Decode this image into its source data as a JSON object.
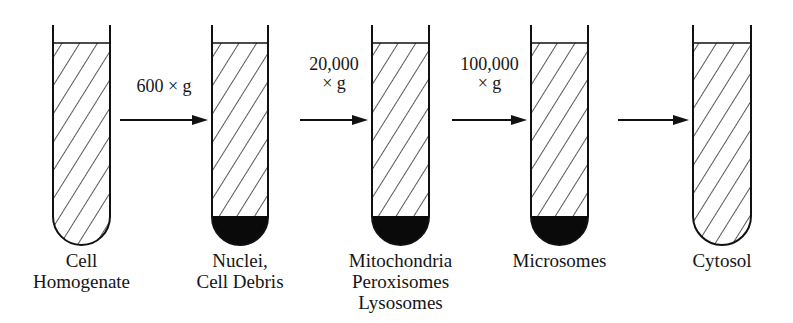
{
  "figure": {
    "colors": {
      "line": "#111111",
      "pellet": "#0a0a0a",
      "background": "#ffffff"
    }
  },
  "tubes": [
    {
      "id": "tube-1",
      "label_lines": [
        "Cell",
        "Homogenate"
      ],
      "pellet": false
    },
    {
      "id": "tube-2",
      "label_lines": [
        "Nuclei,",
        "Cell Debris"
      ],
      "pellet": true
    },
    {
      "id": "tube-3",
      "label_lines": [
        "Mitochondria",
        "Peroxisomes",
        "Lysosomes"
      ],
      "pellet": true
    },
    {
      "id": "tube-4",
      "label_lines": [
        "Microsomes"
      ],
      "pellet": true
    },
    {
      "id": "tube-5",
      "label_lines": [
        "Cytosol"
      ],
      "pellet": false
    }
  ],
  "arrows": [
    {
      "from": "tube-1",
      "to": "tube-2",
      "label_lines": [
        "600 × g"
      ]
    },
    {
      "from": "tube-2",
      "to": "tube-3",
      "label_lines": [
        "20,000",
        "× g"
      ]
    },
    {
      "from": "tube-3",
      "to": "tube-4",
      "label_lines": [
        "100,000",
        "× g"
      ]
    },
    {
      "from": "tube-4",
      "to": "tube-5",
      "label_lines": []
    }
  ]
}
